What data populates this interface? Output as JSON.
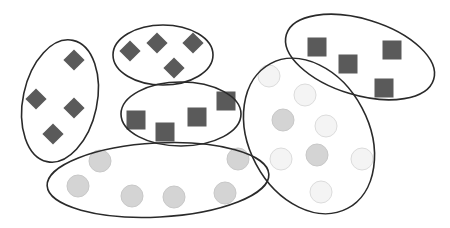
{
  "diagram": {
    "type": "set-clusters",
    "width": 450,
    "height": 228,
    "colors": {
      "background": "#ffffff",
      "outline": "#2a2a2a",
      "dark_shape": "#5a5a5a",
      "circle_medium": "#d4d4d4",
      "circle_light": "#f4f4f4",
      "circle_light_stroke": "#dcdcdc",
      "circle_medium_stroke": "#c8c8c8"
    },
    "clusters": [
      {
        "id": "cluster-left-diamonds",
        "ellipse": {
          "cx": 60,
          "cy": 101,
          "rx": 37,
          "ry": 62,
          "rotate": 12
        },
        "items": [
          {
            "shape": "diamond",
            "x": 74,
            "y": 60,
            "size": 15,
            "fill": "dark"
          },
          {
            "shape": "diamond",
            "x": 36,
            "y": 99,
            "size": 15,
            "fill": "dark"
          },
          {
            "shape": "diamond",
            "x": 74,
            "y": 108,
            "size": 15,
            "fill": "dark"
          },
          {
            "shape": "diamond",
            "x": 53,
            "y": 134,
            "size": 15,
            "fill": "dark"
          }
        ]
      },
      {
        "id": "cluster-top-diamonds",
        "ellipse": {
          "cx": 163,
          "cy": 55,
          "rx": 50,
          "ry": 30,
          "rotate": 0
        },
        "items": [
          {
            "shape": "diamond",
            "x": 130,
            "y": 51,
            "size": 15,
            "fill": "dark"
          },
          {
            "shape": "diamond",
            "x": 157,
            "y": 43,
            "size": 15,
            "fill": "dark"
          },
          {
            "shape": "diamond",
            "x": 193,
            "y": 43,
            "size": 15,
            "fill": "dark"
          },
          {
            "shape": "diamond",
            "x": 174,
            "y": 68,
            "size": 15,
            "fill": "dark"
          }
        ]
      },
      {
        "id": "cluster-middle-squares",
        "ellipse": {
          "cx": 181,
          "cy": 114,
          "rx": 60,
          "ry": 32,
          "rotate": 0
        },
        "items": [
          {
            "shape": "square",
            "x": 136,
            "y": 120,
            "size": 19,
            "fill": "dark"
          },
          {
            "shape": "square",
            "x": 165,
            "y": 132,
            "size": 19,
            "fill": "dark"
          },
          {
            "shape": "square",
            "x": 197,
            "y": 117,
            "size": 19,
            "fill": "dark"
          },
          {
            "shape": "square",
            "x": 226,
            "y": 101,
            "size": 19,
            "fill": "dark"
          }
        ]
      },
      {
        "id": "cluster-top-right-squares",
        "ellipse": {
          "cx": 360,
          "cy": 57,
          "rx": 77,
          "ry": 38,
          "rotate": 17
        },
        "items": [
          {
            "shape": "square",
            "x": 317,
            "y": 47,
            "size": 19,
            "fill": "dark"
          },
          {
            "shape": "square",
            "x": 348,
            "y": 64,
            "size": 19,
            "fill": "dark"
          },
          {
            "shape": "square",
            "x": 392,
            "y": 50,
            "size": 19,
            "fill": "dark"
          },
          {
            "shape": "square",
            "x": 384,
            "y": 88,
            "size": 19,
            "fill": "dark"
          }
        ]
      },
      {
        "id": "cluster-right-circles",
        "ellipse": {
          "cx": 309,
          "cy": 136,
          "rx": 60,
          "ry": 82,
          "rotate": -28
        },
        "items": [
          {
            "shape": "circle",
            "x": 269,
            "y": 76,
            "r": 11,
            "fill": "light"
          },
          {
            "shape": "circle",
            "x": 305,
            "y": 95,
            "r": 11,
            "fill": "light"
          },
          {
            "shape": "circle",
            "x": 283,
            "y": 120,
            "r": 11,
            "fill": "medium"
          },
          {
            "shape": "circle",
            "x": 326,
            "y": 126,
            "r": 11,
            "fill": "light"
          },
          {
            "shape": "circle",
            "x": 281,
            "y": 159,
            "r": 11,
            "fill": "light"
          },
          {
            "shape": "circle",
            "x": 317,
            "y": 155,
            "r": 11,
            "fill": "medium"
          },
          {
            "shape": "circle",
            "x": 362,
            "y": 159,
            "r": 11,
            "fill": "light"
          },
          {
            "shape": "circle",
            "x": 321,
            "y": 192,
            "r": 11,
            "fill": "light"
          }
        ]
      },
      {
        "id": "cluster-bottom-circles",
        "ellipse": {
          "cx": 158,
          "cy": 180,
          "rx": 111,
          "ry": 37,
          "rotate": -3
        },
        "items": [
          {
            "shape": "circle",
            "x": 100,
            "y": 161,
            "r": 11,
            "fill": "medium"
          },
          {
            "shape": "circle",
            "x": 78,
            "y": 186,
            "r": 11,
            "fill": "medium"
          },
          {
            "shape": "circle",
            "x": 132,
            "y": 196,
            "r": 11,
            "fill": "medium"
          },
          {
            "shape": "circle",
            "x": 174,
            "y": 197,
            "r": 11,
            "fill": "medium"
          },
          {
            "shape": "circle",
            "x": 225,
            "y": 193,
            "r": 11,
            "fill": "medium"
          },
          {
            "shape": "circle",
            "x": 238,
            "y": 159,
            "r": 11,
            "fill": "medium"
          }
        ]
      }
    ]
  }
}
